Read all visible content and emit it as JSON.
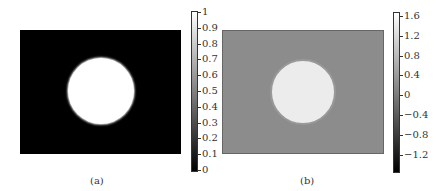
{
  "chart_data": [
    {
      "type": "heatmap",
      "label": "(a)",
      "description": "Grayscale image: white circle on black background",
      "background_value": 0,
      "circle_value": 1,
      "colorbar": {
        "min": 0,
        "max": 1,
        "ticks": [
          "1",
          "0.9",
          "0.8",
          "0.7",
          "0.6",
          "0.5",
          "0.4",
          "0.3",
          "0.2",
          "0.1",
          "0"
        ]
      }
    },
    {
      "type": "heatmap",
      "label": "(b)",
      "description": "Grayscale image: light circle on mid-gray background with dark edge ring",
      "background_value": 0,
      "circle_value": 1.2,
      "colorbar": {
        "min": -1.4,
        "max": 1.6,
        "ticks": [
          "1.6",
          "1.2",
          "0.8",
          "0.4",
          "0",
          "−0.4",
          "−0.8",
          "−1.2"
        ]
      }
    }
  ],
  "captions": {
    "a": "(a)",
    "b": "(b)"
  }
}
